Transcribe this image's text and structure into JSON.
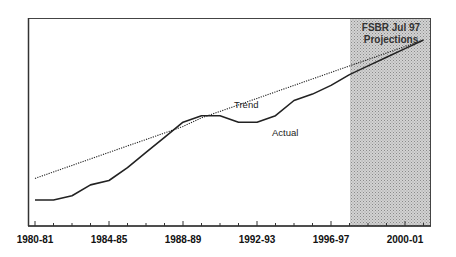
{
  "chart_data": {
    "type": "line",
    "title": "",
    "xlabel": "",
    "ylabel": "",
    "grid": false,
    "legend": "inline annotations",
    "x": [
      "1980-81",
      "1981-82",
      "1982-83",
      "1983-84",
      "1984-85",
      "1985-86",
      "1986-87",
      "1987-88",
      "1988-89",
      "1989-90",
      "1990-91",
      "1991-92",
      "1992-93",
      "1993-94",
      "1994-95",
      "1995-96",
      "1996-97",
      "1997-98",
      "1998-99",
      "1999-00",
      "2000-01",
      "2001-02"
    ],
    "tick_labels": [
      "1980-81",
      "1984-85",
      "1988-89",
      "1992-93",
      "1996-97",
      "2000-01"
    ],
    "y_units": "relative index (no y-axis labels shown)",
    "ylim": [
      0,
      100
    ],
    "series": [
      {
        "name": "Actual",
        "style": "solid",
        "values": [
          10,
          10,
          12,
          17,
          19,
          25,
          32,
          39,
          46,
          49,
          49,
          46,
          46,
          49,
          56,
          59,
          63,
          68,
          72,
          76,
          80,
          84
        ]
      },
      {
        "name": "Trend",
        "style": "dotted",
        "values": [
          20,
          23,
          26,
          29,
          32,
          35,
          38,
          41,
          44,
          48,
          51,
          54,
          57,
          60,
          63,
          66,
          69,
          72,
          75,
          78,
          81,
          84
        ]
      }
    ],
    "annotations": [
      {
        "text": "Trend",
        "near": "1991-92"
      },
      {
        "text": "Actual",
        "near": "1993-94"
      }
    ],
    "shaded_region": {
      "label_line1": "FSBR Jul 97",
      "label_line2": "Projections",
      "from": "1997-98",
      "to": "2001-02"
    }
  },
  "labels": {
    "trend": "Trend",
    "actual": "Actual",
    "proj1": "FSBR Jul 97",
    "proj2": "Projections",
    "t0": "1980-81",
    "t1": "1984-85",
    "t2": "1988-89",
    "t3": "1992-93",
    "t4": "1996-97",
    "t5": "2000-01"
  }
}
